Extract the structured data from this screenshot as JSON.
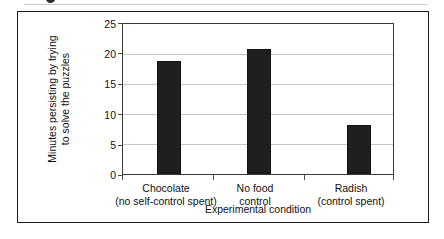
{
  "chart_data": {
    "type": "bar",
    "title": "",
    "subtitle": "",
    "categories": [
      "Chocolate (no self-control spent)",
      "No food control",
      "Radish (control spent)"
    ],
    "category_lines": [
      [
        "Chocolate",
        "(no self-control spent)"
      ],
      [
        "No food",
        "control"
      ],
      [
        "Radish",
        "(control spent)"
      ]
    ],
    "values": [
      18.9,
      20.8,
      8.2
    ],
    "xlabel": "Experimental condition",
    "ylabel": "Minutes persisting by trying to solve the puzzles",
    "ylabel_lines": [
      "Minutes persisting by trying",
      "to solve the puzzles"
    ],
    "ylim": [
      0,
      25
    ],
    "ytick_labels": [
      "0",
      "5",
      "10",
      "15",
      "20",
      "25"
    ],
    "ytick_values": [
      0,
      5,
      10,
      15,
      20,
      25
    ],
    "grid": true,
    "grid_axis": "y",
    "legend": false,
    "legend_position": "none",
    "bar_color": "#1f1f1f",
    "gridline_color": "#c6c6c6",
    "axis_color": "#3a3a3a",
    "background_color": "#ffffff"
  },
  "figure": {
    "border_color": "#1d1d1d"
  }
}
